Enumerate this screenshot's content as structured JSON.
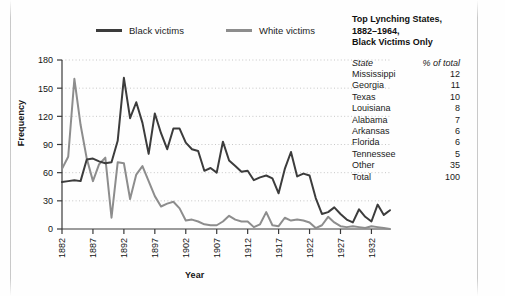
{
  "legend": {
    "entries": [
      {
        "label": "Black victims",
        "color": "#3c3c3c"
      },
      {
        "label": "White victims",
        "color": "#8d8d8d"
      }
    ]
  },
  "side_panel": {
    "title_line1": "Top Lynching States,",
    "title_line2": "1882–1964,",
    "title_line3": "Black Victims Only",
    "columns": [
      "State",
      "% of total"
    ],
    "rows": [
      {
        "state": "Mississippi",
        "pct": "12"
      },
      {
        "state": "Georgia",
        "pct": "11"
      },
      {
        "state": "Texas",
        "pct": "10"
      },
      {
        "state": "Louisiana",
        "pct": "8"
      },
      {
        "state": "Alabama",
        "pct": "7"
      },
      {
        "state": "Arkansas",
        "pct": "6"
      },
      {
        "state": "Florida",
        "pct": "6"
      },
      {
        "state": "Tennessee",
        "pct": "5"
      },
      {
        "state": "Other",
        "pct": "35"
      },
      {
        "state": "Total",
        "pct": "100"
      }
    ]
  },
  "chart_data": {
    "type": "line",
    "title": "",
    "xlabel": "Year",
    "ylabel": "Frequency",
    "xlim": [
      1882,
      1935
    ],
    "ylim": [
      0,
      180
    ],
    "yticks": [
      0,
      30,
      60,
      90,
      120,
      150,
      180
    ],
    "xticks": [
      1882,
      1887,
      1892,
      1897,
      1902,
      1907,
      1912,
      1917,
      1922,
      1927,
      1932
    ],
    "grid": "horizontal-dotted",
    "legend_position": "top",
    "x": [
      1882,
      1883,
      1884,
      1885,
      1886,
      1887,
      1888,
      1889,
      1890,
      1891,
      1892,
      1893,
      1894,
      1895,
      1896,
      1897,
      1898,
      1899,
      1900,
      1901,
      1902,
      1903,
      1904,
      1905,
      1906,
      1907,
      1908,
      1909,
      1910,
      1911,
      1912,
      1913,
      1914,
      1915,
      1916,
      1917,
      1918,
      1919,
      1920,
      1921,
      1922,
      1923,
      1924,
      1925,
      1926,
      1927,
      1928,
      1929,
      1930,
      1931,
      1932,
      1933,
      1934,
      1935
    ],
    "series": [
      {
        "name": "Black victims",
        "color": "#3c3c3c",
        "values": [
          50,
          51,
          52,
          51,
          74,
          75,
          72,
          70,
          71,
          94,
          161,
          118,
          135,
          113,
          80,
          123,
          102,
          85,
          107,
          107,
          92,
          85,
          83,
          62,
          65,
          60,
          93,
          73,
          67,
          61,
          62,
          52,
          55,
          57,
          54,
          38,
          64,
          82,
          56,
          59,
          57,
          33,
          16,
          18,
          23,
          16,
          10,
          7,
          21,
          13,
          8,
          26,
          15,
          20
        ]
      },
      {
        "name": "White victims",
        "color": "#8d8d8d",
        "values": [
          64,
          77,
          160,
          111,
          75,
          51,
          69,
          76,
          12,
          71,
          70,
          32,
          58,
          67,
          51,
          35,
          24,
          27,
          29,
          22,
          9,
          10,
          8,
          5,
          4,
          4,
          8,
          14,
          10,
          8,
          8,
          2,
          5,
          18,
          4,
          3,
          12,
          9,
          10,
          9,
          7,
          1,
          4,
          13,
          7,
          3,
          2,
          3,
          2,
          1,
          3,
          2,
          1,
          0
        ]
      }
    ]
  }
}
